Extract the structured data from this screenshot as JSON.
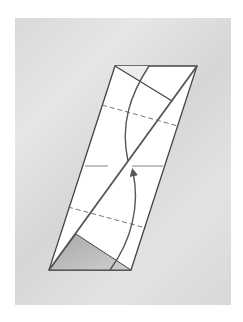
{
  "diagram": {
    "type": "origami-fold-step",
    "background_color": "#dcdcdc",
    "paper_color": "#ffffff",
    "line_color": "#555555",
    "shaded_color": "#bdbdbd",
    "labels": []
  }
}
